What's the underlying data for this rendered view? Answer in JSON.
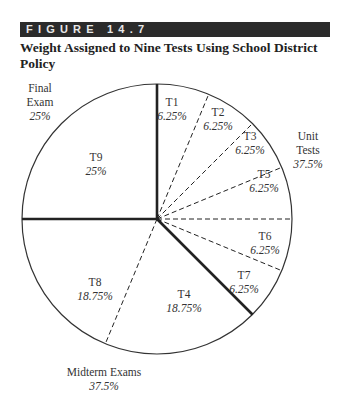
{
  "figure": {
    "label": "FIGURE 14.7",
    "title": "Weight Assigned to Nine Tests Using School District Policy",
    "bar_color": "#2b2b2b"
  },
  "chart_data": {
    "type": "pie",
    "title": "Weight Assigned to Nine Tests Using School District Policy",
    "start_angle_deg": 0,
    "direction": "clockwise",
    "slices": [
      {
        "label": "T1",
        "value": 6.25,
        "display": "6.25%",
        "group": "Unit Tests"
      },
      {
        "label": "T2",
        "value": 6.25,
        "display": "6.25%",
        "group": "Unit Tests"
      },
      {
        "label": "T3",
        "value": 6.25,
        "display": "6.25%",
        "group": "Unit Tests"
      },
      {
        "label": "T5",
        "value": 6.25,
        "display": "6.25%",
        "group": "Unit Tests"
      },
      {
        "label": "T6",
        "value": 6.25,
        "display": "6.25%",
        "group": "Unit Tests"
      },
      {
        "label": "T7",
        "value": 6.25,
        "display": "6.25%",
        "group": "Unit Tests"
      },
      {
        "label": "T4",
        "value": 18.75,
        "display": "18.75%",
        "group": "Midterm Exams"
      },
      {
        "label": "T8",
        "value": 18.75,
        "display": "18.75%",
        "group": "Midterm Exams"
      },
      {
        "label": "T9",
        "value": 25,
        "display": "25%",
        "group": "Final Exam"
      }
    ],
    "groups": [
      {
        "name": "Unit Tests",
        "lines": [
          "Unit",
          "Tests"
        ],
        "value": 37.5,
        "display": "37.5%"
      },
      {
        "name": "Midterm Exams",
        "lines": [
          "Midterm Exams"
        ],
        "value": 37.5,
        "display": "37.5%"
      },
      {
        "name": "Final Exam",
        "lines": [
          "Final",
          "Exam"
        ],
        "value": 25,
        "display": "25%"
      }
    ],
    "line_styles": {
      "within_group": "dashed",
      "between_groups": "bold"
    }
  }
}
